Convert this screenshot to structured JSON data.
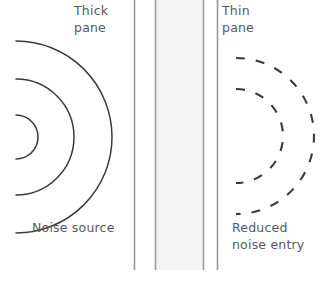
{
  "diagram": {
    "title_labels": {
      "thick_pane": "Thick\npane",
      "thin_pane": "Thin\npane",
      "noise_source": "Noise source",
      "reduced_noise_entry": "Reduced\nnoise entry"
    },
    "colors": {
      "background": "#ffffff",
      "text": "#595959",
      "pane_line": "#9a9a9a",
      "cavity_fill": "#f4f4f4",
      "wave_solid": "#3b3b3b",
      "wave_dashed": "#3b3b3b"
    },
    "panes": [
      {
        "name": "thick-pane-outer-edge",
        "x": 134,
        "y_top": 0,
        "y_bottom": 270
      },
      {
        "name": "thick-pane-inner-edge",
        "x": 155,
        "y_top": 0,
        "y_bottom": 270
      },
      {
        "name": "thin-pane-outer-edge",
        "x": 203,
        "y_top": 0,
        "y_bottom": 270
      },
      {
        "name": "thin-pane-inner-edge",
        "x": 217,
        "y_top": 0,
        "y_bottom": 270
      }
    ],
    "cavity": {
      "x": 155,
      "width": 48,
      "y_top": 0,
      "y_bottom": 270
    },
    "incident_waves": {
      "style": "solid",
      "center_x": 16,
      "center_y": 137,
      "radii": [
        22,
        58,
        96
      ]
    },
    "transmitted_waves": {
      "style": "dashed",
      "center_x": 236,
      "center_y": 136,
      "radii": [
        47,
        78
      ],
      "dash": "9 11"
    }
  }
}
